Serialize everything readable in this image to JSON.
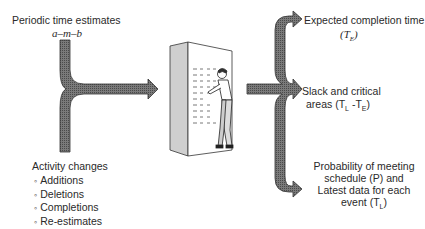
{
  "inputs": {
    "periodic": {
      "title": "Periodic time estimates",
      "formula": "a–m–b"
    },
    "activity_changes": {
      "title": "Activity changes",
      "items": [
        "Additions",
        "Deletions",
        "Completions",
        "Re-estimates"
      ]
    }
  },
  "outputs": {
    "expected": {
      "line1": "Expected completion time",
      "line2": "(T",
      "sub": "E",
      "close": ")"
    },
    "slack": {
      "line1": "Slack and critical",
      "line2a": "areas (T",
      "sub1": "L",
      "mid": " -T",
      "sub2": "E",
      "close": ")"
    },
    "probability": {
      "line1": "Probability of meeting",
      "line2": "schedule (P) and",
      "line3": "Latest data for each",
      "line4a": "event (T",
      "sub": "L",
      "close": ")"
    }
  },
  "illustration": {
    "description": "man-at-computer-cabinet"
  },
  "colors": {
    "arrow_fill": "#6e6e6e",
    "arrow_stroke": "#333333",
    "cabinet_side": "#c9c9c9",
    "cabinet_front": "#ffffff"
  }
}
